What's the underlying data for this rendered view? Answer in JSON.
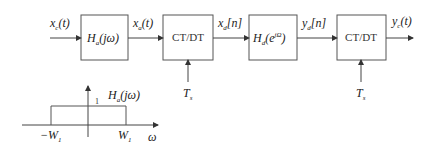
{
  "diagram": {
    "signals": {
      "input": {
        "main": "x",
        "sub": "c",
        "arg": "(t)"
      },
      "after_filter": {
        "main": "x",
        "sub": "a",
        "arg": "(t)"
      },
      "discrete_in": {
        "main": "x",
        "sub": "d",
        "arg": "[n]"
      },
      "discrete_out": {
        "main": "y",
        "sub": "d",
        "arg": "[n]"
      },
      "output": {
        "main": "y",
        "sub": "c",
        "arg": "(t)"
      }
    },
    "blocks": [
      {
        "id": "anti-alias-filter",
        "main": "H",
        "sub": "a",
        "arg": "(jω)"
      },
      {
        "id": "ct-dt-1",
        "label": "CT/DT"
      },
      {
        "id": "discrete-filter",
        "main": "H",
        "sub": "d",
        "arg": "(e",
        "sup": "jΩ",
        "close": ")"
      },
      {
        "id": "ct-dt-2",
        "label": "CT/DT"
      }
    ],
    "sampling": [
      {
        "main": "T",
        "sub": "s"
      },
      {
        "main": "T",
        "sub": "s"
      }
    ],
    "plot": {
      "title_main": "H",
      "title_sub": "a",
      "title_arg": "(jω)",
      "height_label": "1",
      "left_tick": {
        "main": "−W",
        "sub": "1"
      },
      "right_tick": {
        "main": "W",
        "sub": "1"
      },
      "axis_label": "ω"
    }
  },
  "colors": {
    "line": "#444444",
    "text": "#222222"
  }
}
